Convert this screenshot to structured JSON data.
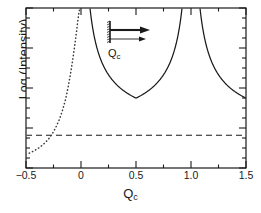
{
  "chart_data": {
    "type": "line",
    "title": "",
    "xlabel": "Qc",
    "xlabel_base": "Q",
    "xlabel_sub": "c",
    "ylabel": "Log (Intensity)",
    "xlim": [
      -0.5,
      1.5
    ],
    "ylim": [
      0,
      1
    ],
    "grid": false,
    "legend": "none",
    "xticks": [
      -0.5,
      0,
      0.5,
      1.0,
      1.5
    ],
    "xticklabels": [
      "−0.5",
      "0",
      "0.5",
      "1.0",
      "1.5"
    ],
    "xminorticks": [
      -0.25,
      0.25,
      0.75,
      1.25
    ],
    "yticklabels": [],
    "ytick_count": 17,
    "ymajortick_every": 4,
    "series": [
      {
        "name": "specular-reflectivity",
        "style": "solid",
        "color": "#1a1a1a",
        "description": "Bragg-like curve with poles at Qc = 0 and Qc = 1.0, minimum near Qc = 0.5",
        "poles": [
          0.0,
          1.0
        ],
        "minimum_x": 0.5,
        "x": [
          0.02,
          0.05,
          0.08,
          0.12,
          0.16,
          0.2,
          0.25,
          0.3,
          0.35,
          0.4,
          0.45,
          0.5,
          0.55,
          0.6,
          0.65,
          0.7,
          0.75,
          0.8,
          0.85,
          0.88,
          0.92,
          0.95,
          0.98,
          1.02,
          1.05,
          1.08,
          1.12,
          1.16,
          1.2,
          1.25,
          1.3,
          1.35,
          1.4,
          1.45,
          1.5
        ],
        "y": [
          0.97,
          0.88,
          0.78,
          0.66,
          0.56,
          0.48,
          0.39,
          0.32,
          0.26,
          0.21,
          0.18,
          0.165,
          0.18,
          0.21,
          0.26,
          0.32,
          0.39,
          0.48,
          0.6,
          0.68,
          0.8,
          0.88,
          0.96,
          0.96,
          0.88,
          0.8,
          0.68,
          0.58,
          0.49,
          0.4,
          0.33,
          0.28,
          0.24,
          0.21,
          0.19
        ]
      },
      {
        "name": "off-specular-background",
        "style": "dotted",
        "color": "#3a3a3a",
        "description": "Rises steeply from the lower-left toward the pole at Qc = 0",
        "x": [
          -0.5,
          -0.47,
          -0.44,
          -0.41,
          -0.38,
          -0.35,
          -0.32,
          -0.29,
          -0.26,
          -0.23,
          -0.2,
          -0.17,
          -0.14,
          -0.12,
          -0.1,
          -0.08,
          -0.06,
          -0.04,
          -0.03,
          -0.02,
          -0.01
        ],
        "y": [
          0.085,
          0.093,
          0.103,
          0.114,
          0.127,
          0.143,
          0.162,
          0.186,
          0.215,
          0.252,
          0.298,
          0.356,
          0.43,
          0.495,
          0.57,
          0.655,
          0.75,
          0.855,
          0.915,
          0.965,
          1.0
        ]
      },
      {
        "name": "background-level",
        "style": "dashed",
        "color": "#1a1a1a",
        "description": "Horizontal dashed reference line across the full axis",
        "y_value": 0.205,
        "orientation": "horizontal"
      }
    ],
    "inset": {
      "name": "scattering-geometry",
      "label_base": "Q",
      "label_sub": "c",
      "elements": [
        "vertical-sample-bar",
        "incident-beam-arrow",
        "scattered-beam-arrow",
        "momentum-transfer-arrow"
      ]
    }
  }
}
